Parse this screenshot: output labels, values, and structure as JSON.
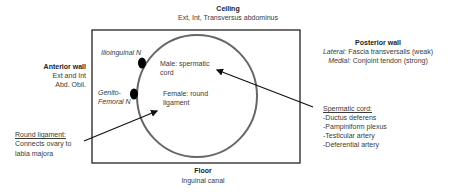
{
  "ceiling": {
    "title": "Ceiling",
    "text": "Ext, Int, Transversus abdominus"
  },
  "anterior_wall": {
    "title": "Anterior wall",
    "line1": "Ext and Int",
    "line2": "Abd. Obli."
  },
  "posterior_wall": {
    "title": "Posterior wall",
    "lateral_label": "Lateral:",
    "lateral_text": " Fascia transversalis (weak)",
    "medial_label": "Medial:",
    "medial_text": " Conjoint tendon (strong)"
  },
  "floor": {
    "title": "Floor",
    "text": "Inguinal canal"
  },
  "nerves": {
    "ilioinguinal": "Ilioinguinal N",
    "genito_line1": "Genito-",
    "genito_line2": "Femoral N"
  },
  "ring": {
    "male_line1": "Male: spermatic",
    "male_line2": "cord",
    "female_line1": "Female: round",
    "female_line2": "ligament"
  },
  "round_ligament": {
    "title": "Round ligament:",
    "line1": "Connects ovary to",
    "line2": "labia majora"
  },
  "spermatic_cord": {
    "title": "Spermatic cord:",
    "items": [
      "-Ductus deferens",
      "-Pampiniform plexus",
      "-Testicular artery",
      "-Deferential artery"
    ]
  },
  "colors": {
    "box": "#222222",
    "circle": "#666666",
    "arrow": "#111111",
    "dot": "#000000"
  }
}
